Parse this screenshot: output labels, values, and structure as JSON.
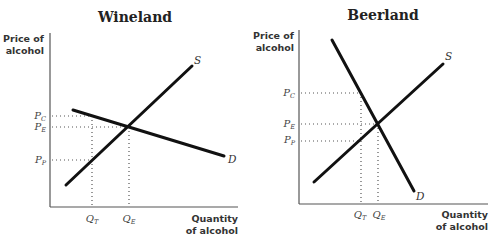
{
  "panels": [
    {
      "title": "Wineland",
      "y_axis_label": [
        "Price of",
        "alcohol"
      ],
      "x_axis_label": [
        "Quantity",
        "of alcohol"
      ],
      "price_ticks": [
        {
          "main": "P",
          "sub": "C"
        },
        {
          "main": "P",
          "sub": "E"
        },
        {
          "main": "P",
          "sub": "P"
        }
      ],
      "quantity_ticks": [
        {
          "main": "Q",
          "sub": "T"
        },
        {
          "main": "Q",
          "sub": "E"
        }
      ],
      "supply_label": "S",
      "demand_label": "D"
    },
    {
      "title": "Beerland",
      "y_axis_label": [
        "Price of",
        "alcohol"
      ],
      "x_axis_label": [
        "Quantity",
        "of alcohol"
      ],
      "price_ticks": [
        {
          "main": "P",
          "sub": "C"
        },
        {
          "main": "P",
          "sub": "E"
        },
        {
          "main": "P",
          "sub": "P"
        }
      ],
      "quantity_ticks": [
        {
          "main": "Q",
          "sub": "T"
        },
        {
          "main": "Q",
          "sub": "E"
        }
      ],
      "supply_label": "S",
      "demand_label": "D"
    }
  ]
}
